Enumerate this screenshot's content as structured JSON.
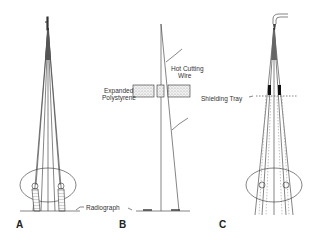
{
  "figure": {
    "panels": [
      {
        "id": "A",
        "label": "A"
      },
      {
        "id": "B",
        "label": "B"
      },
      {
        "id": "C",
        "label": "C"
      }
    ],
    "annotations": {
      "radiograph": "Radiograph",
      "expanded_line1": "Expanded",
      "expanded_line2": "Polystyrene",
      "hot_cutting_line1": "Hot Cutting",
      "hot_cutting_line2": "Wire",
      "shielding_tray": "Shielding Tray"
    },
    "colors": {
      "line": "#333333",
      "background": "#ffffff",
      "block_fill": "#dddddd",
      "shield": "#111111"
    }
  }
}
